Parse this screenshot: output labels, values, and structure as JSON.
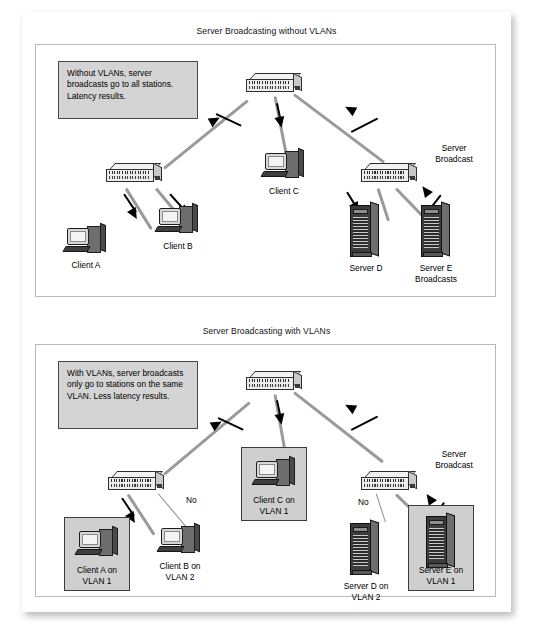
{
  "panels": [
    {
      "title": "Server Broadcasting without VLANs",
      "callout": "Without VLANs, server broadcasts go to all stations. Latency results.",
      "side_label": "Server\nBroadcast",
      "nodes": [
        {
          "name": "core-switch",
          "type": "switch",
          "label": ""
        },
        {
          "name": "left-switch",
          "type": "switch",
          "label": ""
        },
        {
          "name": "right-switch",
          "type": "switch",
          "label": ""
        },
        {
          "name": "client-a",
          "type": "computer",
          "label": "Client A"
        },
        {
          "name": "client-b",
          "type": "computer",
          "label": "Client B"
        },
        {
          "name": "client-c",
          "type": "computer",
          "label": "Client C"
        },
        {
          "name": "server-d",
          "type": "server",
          "label": "Server D"
        },
        {
          "name": "server-e",
          "type": "server",
          "label": "Server E\nBroadcasts"
        }
      ]
    },
    {
      "title": "Server Broadcasting with VLANs",
      "callout": "With VLANs, server broadcasts only go to stations on the same VLAN. Less latency results.",
      "side_label": "Server\nBroadcast",
      "no_label_1": "No",
      "no_label_2": "No",
      "nodes": [
        {
          "name": "core-switch",
          "type": "switch",
          "label": ""
        },
        {
          "name": "left-switch",
          "type": "switch",
          "label": ""
        },
        {
          "name": "right-switch",
          "type": "switch",
          "label": ""
        },
        {
          "name": "client-a",
          "type": "computer",
          "label": "Client A on\nVLAN 1",
          "vlan": 1,
          "highlighted": true
        },
        {
          "name": "client-b",
          "type": "computer",
          "label": "Client B on\nVLAN 2",
          "vlan": 2,
          "highlighted": false
        },
        {
          "name": "client-c",
          "type": "computer",
          "label": "Client C on\nVLAN 1",
          "vlan": 1,
          "highlighted": true
        },
        {
          "name": "server-d",
          "type": "server",
          "label": "Server D on\nVLAN 2",
          "vlan": 2,
          "highlighted": false
        },
        {
          "name": "server-e",
          "type": "server",
          "label": "Server E on\nVLAN 1",
          "vlan": 1,
          "highlighted": true
        }
      ]
    }
  ],
  "colors": {
    "callout_fill": "#d4d4d4",
    "vlan_box_fill": "#cfcfcf",
    "link": "#9a9a9a",
    "arrow": "#000000",
    "panel_border": "#b9b9b9"
  }
}
